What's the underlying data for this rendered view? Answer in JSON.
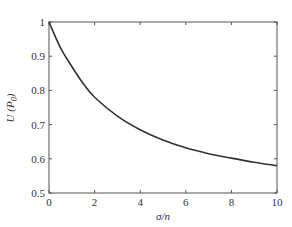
{
  "chart_data": {
    "type": "line",
    "title": "",
    "xlabel": "σ/n",
    "ylabel": "U (P0)",
    "xlim": [
      0,
      10
    ],
    "ylim": [
      0.5,
      1
    ],
    "grid": false,
    "x_ticks": [
      "0",
      "2",
      "4",
      "6",
      "8",
      "10"
    ],
    "y_ticks": [
      "0.5",
      "0.6",
      "0.7",
      "0.8",
      "0.9",
      "1"
    ],
    "series": [
      {
        "name": "U",
        "x": [
          0,
          0.5,
          1,
          1.5,
          2,
          3,
          4,
          5,
          6,
          7,
          8,
          9,
          10
        ],
        "values": [
          1.0,
          0.925,
          0.87,
          0.82,
          0.78,
          0.725,
          0.685,
          0.655,
          0.632,
          0.615,
          0.602,
          0.59,
          0.58
        ]
      }
    ],
    "line_color": "#333333"
  }
}
